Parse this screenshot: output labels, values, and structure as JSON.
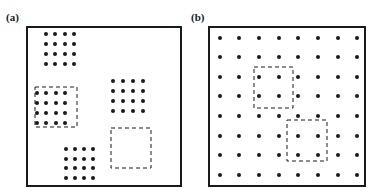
{
  "figure": {
    "panels": [
      {
        "label": "(a)",
        "label_pos": [
          6,
          11
        ],
        "frame": {
          "x": 27,
          "y": 27,
          "w": 154,
          "h": 159
        },
        "dot_clusters": [
          {
            "cols": [
              46,
              55,
              65,
              74
            ],
            "rows": [
              34,
              44,
              54,
              64
            ]
          },
          {
            "cols": [
              37,
              46,
              56,
              65
            ],
            "rows": [
              93,
              103,
              113,
              123
            ]
          },
          {
            "cols": [
              113,
              123,
              133,
              143
            ],
            "rows": [
              81,
              91,
              101,
              111
            ]
          },
          {
            "cols": [
              66,
              75,
              84,
              93
            ],
            "rows": [
              149,
              159,
              168,
              178
            ]
          }
        ],
        "dashed_boxes": [
          {
            "x": 35,
            "y": 87,
            "w": 42,
            "h": 40
          },
          {
            "x": 111,
            "y": 128,
            "w": 40,
            "h": 40
          }
        ]
      },
      {
        "label": "(b)",
        "label_pos": [
          191,
          11
        ],
        "frame": {
          "x": 209,
          "y": 27,
          "w": 156,
          "h": 159
        },
        "dot_clusters": [
          {
            "cols": [
              220,
              239,
              259,
              279,
              298,
              318,
              338,
              357
            ],
            "rows": [
              38,
              57,
              77,
              96,
              116,
              136,
              155,
              175
            ]
          }
        ],
        "dashed_boxes": [
          {
            "x": 254,
            "y": 67,
            "w": 39,
            "h": 41
          },
          {
            "x": 287,
            "y": 120,
            "w": 40,
            "h": 41
          }
        ]
      }
    ],
    "style": {
      "ink": "#1a1a1a",
      "dot_radius": 2,
      "frame_stroke": 2,
      "dash_stroke": 1,
      "dash_pattern": "4,3"
    }
  }
}
